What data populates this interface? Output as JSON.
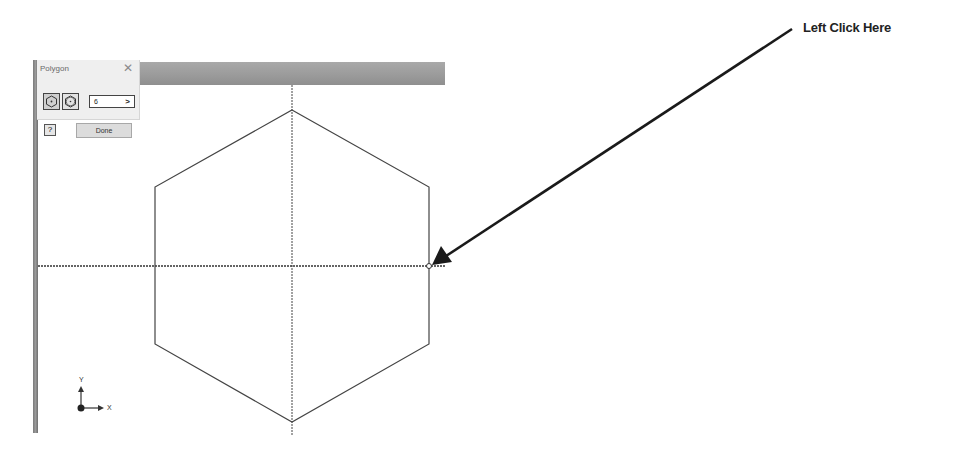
{
  "dialog": {
    "title": "Polygon",
    "close_icon": "close-icon",
    "modes": [
      {
        "name": "inscribed",
        "icon": "inscribed-polygon-icon",
        "active": true
      },
      {
        "name": "circumscribed",
        "icon": "circumscribed-polygon-icon",
        "active": false
      }
    ],
    "sides_value": "6",
    "sides_arrow": ">",
    "help_label": "?",
    "done_label": "Done"
  },
  "annotation": {
    "label": "Left Click Here",
    "arrow_from": [
      792,
      29
    ],
    "arrow_to": [
      432,
      265
    ]
  },
  "sketch": {
    "shape": "hexagon",
    "vertices": [
      [
        292,
        110
      ],
      [
        429,
        187
      ],
      [
        429,
        344
      ],
      [
        292,
        422
      ],
      [
        155,
        344
      ],
      [
        155,
        187
      ]
    ],
    "center": [
      292,
      266
    ],
    "click_point": [
      429,
      266
    ]
  },
  "triad": {
    "x_label": "X",
    "y_label": "Y"
  },
  "colors": {
    "sketch_line": "#444444",
    "bar": "#9a9a9a",
    "arrow": "#1a1a1a"
  }
}
